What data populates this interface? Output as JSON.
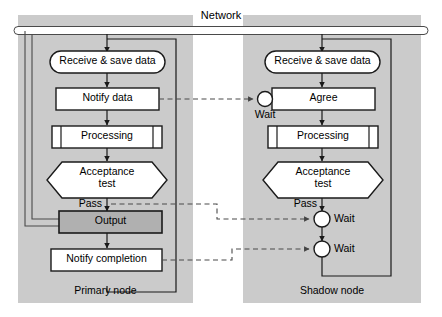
{
  "figure": {
    "background": "#ffffff",
    "panel_fill": "#cccccc",
    "output_fill": "#b3b3b3",
    "shape_fill": "#ffffff",
    "stroke": "#1a1a1a",
    "dashed_stroke": "#555555"
  },
  "network": {
    "label": "Network",
    "bar_shape": "rounded-pill"
  },
  "panels": [
    {
      "id": "primary",
      "caption": "Primary node"
    },
    {
      "id": "shadow",
      "caption": "Shadow node"
    }
  ],
  "primary_node": {
    "caption": "Primary node",
    "steps": [
      {
        "id": "receive",
        "label": "Receive & save data",
        "shape": "stadium"
      },
      {
        "id": "notify_data",
        "label": "Notify data",
        "shape": "rect"
      },
      {
        "id": "processing",
        "label": "Processing",
        "shape": "predefined-process"
      },
      {
        "id": "acceptance",
        "label_line1": "Acceptance",
        "label_line2": "test",
        "shape": "hexagon"
      },
      {
        "id": "output",
        "label": "Output",
        "shape": "rect-filled"
      },
      {
        "id": "notify_completion",
        "label": "Notify completion",
        "shape": "rect"
      }
    ],
    "edge_labels": [
      {
        "id": "pass",
        "label": "Pass"
      }
    ]
  },
  "shadow_node": {
    "caption": "Shadow node",
    "steps": [
      {
        "id": "receive",
        "label": "Receive & save data",
        "shape": "stadium"
      },
      {
        "id": "agree",
        "label": "Agree",
        "shape": "rect"
      },
      {
        "id": "processing",
        "label": "Processing",
        "shape": "predefined-process"
      },
      {
        "id": "acceptance",
        "label_line1": "Acceptance",
        "label_line2": "test",
        "shape": "hexagon"
      },
      {
        "id": "wait_agree",
        "label": "Wait",
        "shape": "circle"
      },
      {
        "id": "wait_1",
        "label": "Wait",
        "shape": "circle"
      },
      {
        "id": "wait_2",
        "label": "Wait",
        "shape": "circle"
      }
    ],
    "edge_labels": [
      {
        "id": "pass",
        "label": "Pass"
      }
    ]
  },
  "messages": [
    {
      "id": "msg_notify_data",
      "from": "primary.notify_data",
      "to": "shadow.wait_agree",
      "style": "dashed"
    },
    {
      "id": "msg_pass",
      "from": "primary.pass",
      "to": "shadow.wait_1",
      "style": "dashed"
    },
    {
      "id": "msg_notify_completion",
      "from": "primary.notify_completion",
      "to": "shadow.wait_2",
      "style": "dashed"
    }
  ]
}
